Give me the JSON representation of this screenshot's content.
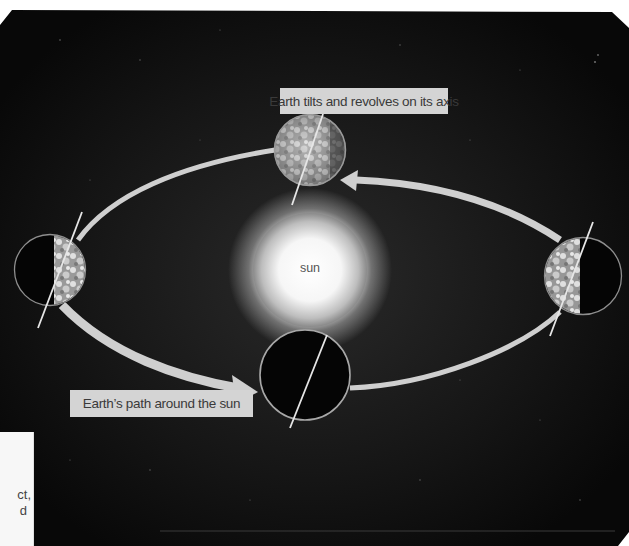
{
  "diagram": {
    "labels": {
      "tilt": "Earth tilts and revolves on its axis",
      "path": "Earth’s path around the sun",
      "sun": "sun"
    },
    "bodies": [
      {
        "name": "sun",
        "cx": 310,
        "cy": 270,
        "r": 57
      },
      {
        "name": "earth-top",
        "cx": 310,
        "cy": 150,
        "r": 35,
        "lit_side": "left"
      },
      {
        "name": "earth-left",
        "cx": 50,
        "cy": 270,
        "r": 35,
        "lit_side": "right"
      },
      {
        "name": "earth-right",
        "cx": 583,
        "cy": 276,
        "r": 38,
        "lit_side": "left"
      },
      {
        "name": "earth-bottom",
        "cx": 305,
        "cy": 375,
        "r": 45,
        "lit_side": "none"
      }
    ],
    "colors": {
      "background": "#0b0b0b",
      "orbit": "#cfcfcf",
      "label_bg": "#d4d4d4",
      "label_text": "#3a3a3a"
    }
  },
  "side_panel": {
    "fragments": [
      "ct,",
      "d"
    ]
  }
}
